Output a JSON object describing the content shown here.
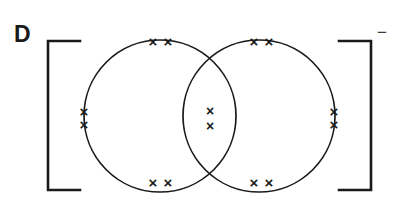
{
  "figure": {
    "panel_label": "D",
    "charge_label": "−",
    "ink_color": "#1a1a1a",
    "background_color": "#ffffff",
    "description_type": "lewis-dot-bonding-diagram"
  },
  "brackets": {
    "left": {
      "x": 48,
      "top": 41,
      "bottom": 190,
      "tick_length": 32
    },
    "right": {
      "x": 371,
      "top": 41,
      "bottom": 190,
      "tick_length": 32
    },
    "stroke_width": 2.6
  },
  "circles": [
    {
      "name": "left-atom-circle",
      "cx": 160,
      "cy": 116,
      "r": 76,
      "stroke_width": 1.7
    },
    {
      "name": "right-atom-circle",
      "cx": 259,
      "cy": 116,
      "r": 76,
      "stroke_width": 1.7
    }
  ],
  "electron_marks": {
    "glyph": "×",
    "color": "#1a1a1a",
    "groups": [
      {
        "name": "left-circle-top-pair",
        "orientation": "horizontal",
        "count": 2,
        "positions": [
          {
            "x": 153,
            "y": 41
          },
          {
            "x": 168,
            "y": 41
          }
        ],
        "size": 15
      },
      {
        "name": "left-circle-left-pair",
        "orientation": "vertical",
        "count": 2,
        "positions": [
          {
            "x": 84,
            "y": 111
          },
          {
            "x": 84,
            "y": 124
          }
        ],
        "size": 15
      },
      {
        "name": "left-circle-bottom-pair",
        "orientation": "horizontal",
        "count": 2,
        "positions": [
          {
            "x": 153,
            "y": 182
          },
          {
            "x": 168,
            "y": 182
          }
        ],
        "size": 15
      },
      {
        "name": "right-circle-top-pair",
        "orientation": "horizontal",
        "count": 2,
        "positions": [
          {
            "x": 254,
            "y": 41
          },
          {
            "x": 269,
            "y": 41
          }
        ],
        "size": 15
      },
      {
        "name": "right-circle-right-pair",
        "orientation": "vertical",
        "count": 2,
        "positions": [
          {
            "x": 334,
            "y": 111
          },
          {
            "x": 334,
            "y": 124
          }
        ],
        "size": 15
      },
      {
        "name": "right-circle-bottom-pair",
        "orientation": "horizontal",
        "count": 2,
        "positions": [
          {
            "x": 254,
            "y": 182
          },
          {
            "x": 269,
            "y": 182
          }
        ],
        "size": 15
      },
      {
        "name": "shared-overlap-pair",
        "orientation": "vertical",
        "count": 2,
        "positions": [
          {
            "x": 210,
            "y": 111
          },
          {
            "x": 210,
            "y": 126
          }
        ],
        "size": 14
      }
    ],
    "total_count": 14
  }
}
